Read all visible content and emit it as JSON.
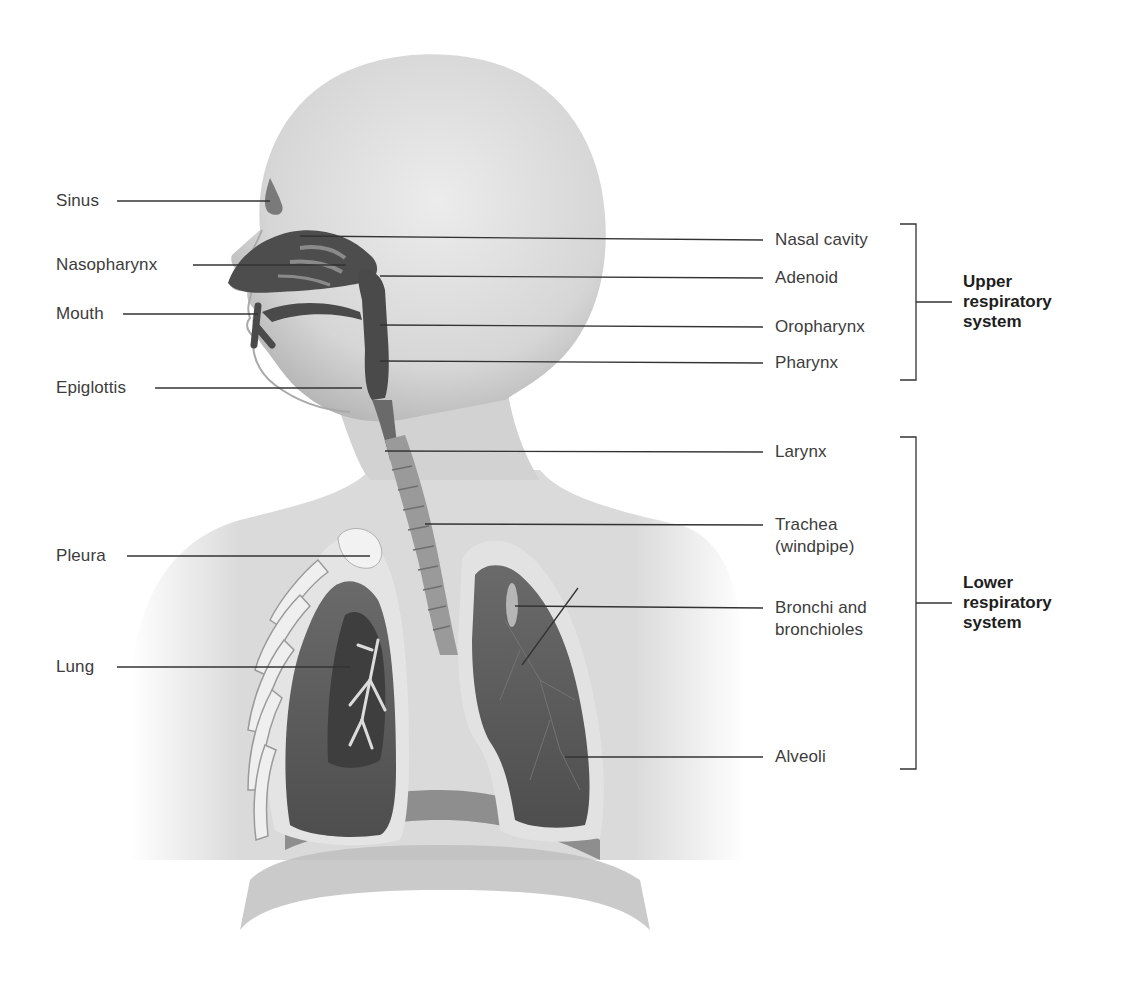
{
  "figure": {
    "left_labels": [
      {
        "id": "sinus",
        "text": "Sinus"
      },
      {
        "id": "nasopharynx",
        "text": "Nasopharynx"
      },
      {
        "id": "mouth",
        "text": "Mouth"
      },
      {
        "id": "epiglottis",
        "text": "Epiglottis"
      },
      {
        "id": "pleura",
        "text": "Pleura"
      },
      {
        "id": "lung",
        "text": "Lung"
      }
    ],
    "right_labels": [
      {
        "id": "nasal-cavity",
        "text": "Nasal cavity"
      },
      {
        "id": "adenoid",
        "text": "Adenoid"
      },
      {
        "id": "oropharynx",
        "text": "Oropharynx"
      },
      {
        "id": "pharynx",
        "text": "Pharynx"
      },
      {
        "id": "larynx",
        "text": "Larynx"
      },
      {
        "id": "trachea",
        "text": "Trachea (windpipe)"
      },
      {
        "id": "bronchi",
        "text": "Bronchi and bronchioles"
      },
      {
        "id": "alveoli",
        "text": "Alveoli"
      }
    ],
    "groups": [
      {
        "id": "upper",
        "text": "Upper respiratory system",
        "members": [
          "Nasal cavity",
          "Adenoid",
          "Oropharynx",
          "Pharynx"
        ]
      },
      {
        "id": "lower",
        "text": "Lower respiratory system",
        "members": [
          "Larynx",
          "Trachea (windpipe)",
          "Bronchi and bronchioles",
          "Alveoli"
        ]
      }
    ],
    "colors": {
      "skin": "#d9d9d9",
      "skin_shadow": "#b5b5b5",
      "airway": "#4a4a4a",
      "lung_tissue": "#5a5a5a",
      "pleura": "#e6e6e6",
      "leader_line": "#333333",
      "label_text": "#3c3c3c",
      "group_text": "#1e1e1e"
    }
  }
}
